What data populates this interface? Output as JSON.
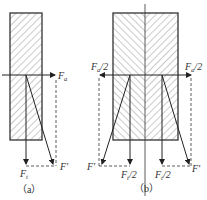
{
  "figure": {
    "panel_a": {
      "caption": "（a）",
      "labels": {
        "axial_force": "F",
        "axial_sub": "a",
        "tangential_force": "F",
        "tangential_sub": "t",
        "resultant": "F'"
      }
    },
    "panel_b": {
      "caption": "（b）",
      "labels": {
        "axial_left": "F",
        "axial_left_sub": "a",
        "axial_left_suffix": "/2",
        "axial_right": "F",
        "axial_right_sub": "a",
        "axial_right_suffix": "/2",
        "tangential_left": "F",
        "tangential_left_sub": "t",
        "tangential_left_suffix": "/2",
        "tangential_right": "F",
        "tangential_right_sub": "t",
        "tangential_right_suffix": "/2",
        "resultant_left": "F'",
        "resultant_right": "F'"
      }
    },
    "colors": {
      "line": "#333333",
      "hatch": "#555555"
    }
  }
}
